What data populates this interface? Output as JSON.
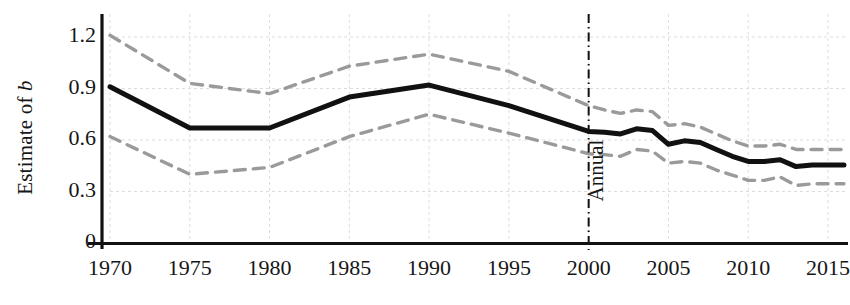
{
  "chart_data": {
    "type": "line",
    "title": "",
    "xlabel": "",
    "ylabel": "Estimate of b",
    "ylabel_plain": "Estimate of ",
    "ylabel_italic": "b",
    "xlim": [
      1970,
      2016
    ],
    "ylim": [
      0,
      1.32
    ],
    "grid": true,
    "legend_position": "none",
    "x_tick_labels": [
      "1970",
      "1975",
      "1980",
      "1985",
      "1990",
      "1995",
      "2000",
      "2005",
      "2010",
      "2015"
    ],
    "x_ticks": [
      1970,
      1975,
      1980,
      1985,
      1990,
      1995,
      2000,
      2005,
      2010,
      2015
    ],
    "y_tick_labels": [
      "1.2",
      "0.9",
      "0.6",
      "0.3",
      "0"
    ],
    "y_ticks": [
      1.2,
      0.9,
      0.6,
      0.3,
      0
    ],
    "annotations": [
      {
        "text": "Annual",
        "x": 2000,
        "orientation": "vertical",
        "marker": "dash-dot vertical line at 2000"
      }
    ],
    "series": [
      {
        "name": "Estimate of b",
        "style": "solid",
        "color": "#111111",
        "width": 5,
        "x": [
          1970,
          1975,
          1980,
          1985,
          1990,
          1995,
          2000,
          2001,
          2002,
          2003,
          2004,
          2005,
          2006,
          2007,
          2008,
          2009,
          2010,
          2011,
          2012,
          2013,
          2014,
          2015,
          2016
        ],
        "values": [
          0.91,
          0.67,
          0.67,
          0.85,
          0.92,
          0.8,
          0.65,
          0.645,
          0.635,
          0.665,
          0.655,
          0.575,
          0.595,
          0.585,
          0.545,
          0.505,
          0.475,
          0.475,
          0.485,
          0.445,
          0.455,
          0.455,
          0.455
        ]
      },
      {
        "name": "Upper confidence band",
        "style": "dashed",
        "color": "#9a9a9a",
        "width": 3.4,
        "x": [
          1970,
          1975,
          1980,
          1985,
          1990,
          1995,
          2000,
          2001,
          2002,
          2003,
          2004,
          2005,
          2006,
          2007,
          2008,
          2009,
          2010,
          2011,
          2012,
          2013,
          2014,
          2015,
          2016
        ],
        "values": [
          1.21,
          0.93,
          0.87,
          1.03,
          1.1,
          1.0,
          0.8,
          0.775,
          0.755,
          0.775,
          0.765,
          0.685,
          0.695,
          0.675,
          0.635,
          0.595,
          0.565,
          0.565,
          0.575,
          0.545,
          0.545,
          0.545,
          0.545
        ]
      },
      {
        "name": "Lower confidence band",
        "style": "dashed",
        "color": "#9a9a9a",
        "width": 3.4,
        "x": [
          1970,
          1975,
          1980,
          1985,
          1990,
          1995,
          2000,
          2001,
          2002,
          2003,
          2004,
          2005,
          2006,
          2007,
          2008,
          2009,
          2010,
          2011,
          2012,
          2013,
          2014,
          2015,
          2016
        ],
        "values": [
          0.62,
          0.4,
          0.44,
          0.62,
          0.75,
          0.64,
          0.52,
          0.515,
          0.505,
          0.545,
          0.535,
          0.465,
          0.475,
          0.465,
          0.425,
          0.395,
          0.365,
          0.365,
          0.385,
          0.335,
          0.345,
          0.345,
          0.345
        ]
      }
    ]
  },
  "axes": {
    "y_axis_line_color": "#111111",
    "x_axis_line_color": "#111111",
    "grid_color": "#dddddd",
    "annual_divider_color": "#111111"
  }
}
